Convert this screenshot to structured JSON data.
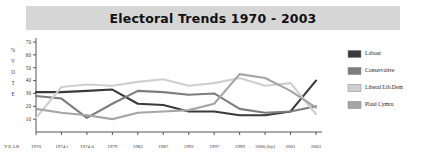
{
  "title": "Electoral Trends 1970 - 2003",
  "axis": {
    "y_label_stacked": [
      "%",
      "V",
      "O",
      "T",
      "E"
    ],
    "x_label": "YEAR"
  },
  "legend": {
    "items": [
      {
        "label": "Labour",
        "color": "#3a3a3a"
      },
      {
        "label": "Conservative",
        "color": "#7d7d7d"
      },
      {
        "label": "Liberal/Lib.Dem",
        "color": "#cfcfcf"
      },
      {
        "label": "Plaid Cymru",
        "color": "#a5a5a5"
      }
    ]
  },
  "chart_data": {
    "type": "line",
    "title": "Electoral Trends 1970 - 2003",
    "xlabel": "YEAR",
    "ylabel": "% VOTE",
    "ylim": [
      0,
      70
    ],
    "yticks": [
      10,
      20,
      30,
      40,
      50,
      60,
      70
    ],
    "grid": false,
    "legend_position": "right",
    "categories": [
      "1970",
      "1974 i",
      "1974 ii",
      "1979",
      "1983",
      "1987",
      "1992",
      "1997",
      "1999",
      "2000 (by)",
      "2001",
      "2003"
    ],
    "series": [
      {
        "name": "Labour",
        "color": "#3a3a3a",
        "values": [
          31,
          31,
          32,
          33,
          22,
          21,
          16,
          16,
          13,
          13,
          16,
          40
        ]
      },
      {
        "name": "Conservative",
        "color": "#7d7d7d",
        "values": [
          28,
          26,
          11,
          22,
          32,
          31,
          29,
          30,
          18,
          15,
          16,
          20
        ]
      },
      {
        "name": "Liberal/Lib.Dem",
        "color": "#cfcfcf",
        "values": [
          11,
          35,
          37,
          36,
          39,
          41,
          36,
          38,
          42,
          36,
          38,
          14
        ]
      },
      {
        "name": "Plaid Cymru",
        "color": "#a5a5a5",
        "values": [
          18,
          15,
          13,
          10,
          15,
          16,
          17,
          22,
          45,
          42,
          32,
          19
        ]
      }
    ]
  }
}
